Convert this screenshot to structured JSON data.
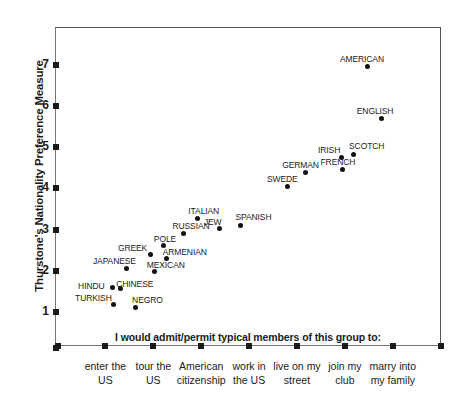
{
  "chart_data": {
    "type": "scatter",
    "title": "",
    "ylabel": "Thurstone's Nationality Preference Measure",
    "xlabel": "",
    "caption": "I would admit/permit typical members of this group to:",
    "ylim": [
      0,
      7.6
    ],
    "yticks": [
      1,
      2,
      3,
      4,
      5,
      6,
      7
    ],
    "ytick_labels": [
      "1",
      "2",
      "3",
      "4",
      "5",
      "6",
      "7"
    ],
    "grid": false,
    "legend": "none",
    "xtick_labels": [
      "enter the\nUS",
      "tour the\nUS",
      "American\ncitizenship",
      "work in\nthe US",
      "live on my\nstreet",
      "join my\nclub",
      "marry into\nmy family"
    ],
    "xticks": [
      {
        "label_line1": "enter the",
        "label_line2": "US"
      },
      {
        "label_line1": "tour the",
        "label_line2": "US"
      },
      {
        "label_line1": "American",
        "label_line2": "citizenship"
      },
      {
        "label_line1": "work in",
        "label_line2": "the US"
      },
      {
        "label_line1": "live on my",
        "label_line2": "street"
      },
      {
        "label_line1": "join my",
        "label_line2": "club"
      },
      {
        "label_line1": "marry into",
        "label_line2": "my family"
      }
    ],
    "point_color": "#111111",
    "axis_color": "#555555",
    "points": [
      {
        "name": "TURKISH",
        "x": 1.16,
        "y": 1.17,
        "lx": -38,
        "ly": -12
      },
      {
        "name": "NEGRO",
        "x": 1.62,
        "y": 1.12,
        "lx": -3,
        "ly": -12
      },
      {
        "name": "HINDU",
        "x": 1.14,
        "y": 1.59,
        "lx": -34,
        "ly": -7
      },
      {
        "name": "CHINESE",
        "x": 1.31,
        "y": 1.58,
        "lx": -4,
        "ly": -9
      },
      {
        "name": "MEXICAN",
        "x": 2.03,
        "y": 1.99,
        "lx": -8,
        "ly": -11
      },
      {
        "name": "JAPANESE",
        "x": 1.45,
        "y": 2.06,
        "lx": -34,
        "ly": -12
      },
      {
        "name": "ARMENIAN",
        "x": 2.28,
        "y": 2.31,
        "lx": -4,
        "ly": -11
      },
      {
        "name": "GREEK",
        "x": 1.95,
        "y": 2.4,
        "lx": -33,
        "ly": -11
      },
      {
        "name": "POLE",
        "x": 2.22,
        "y": 2.62,
        "lx": -10,
        "ly": -11
      },
      {
        "name": "RUSSIAN",
        "x": 2.63,
        "y": 2.91,
        "lx": -11,
        "ly": -12
      },
      {
        "name": "JEW",
        "x": 3.39,
        "y": 3.03,
        "lx": -16,
        "ly": -11
      },
      {
        "name": "SPANISH",
        "x": 3.82,
        "y": 3.1,
        "lx": -5,
        "ly": -13
      },
      {
        "name": "ITALIAN",
        "x": 2.92,
        "y": 3.28,
        "lx": -9,
        "ly": -12
      },
      {
        "name": "SWEDE",
        "x": 4.81,
        "y": 4.05,
        "lx": -21,
        "ly": -12
      },
      {
        "name": "GERMAN",
        "x": 5.17,
        "y": 4.39,
        "lx": -23,
        "ly": -12
      },
      {
        "name": "FRENCH",
        "x": 5.95,
        "y": 4.46,
        "lx": -22,
        "ly": -12
      },
      {
        "name": "IRISH",
        "x": 5.92,
        "y": 4.76,
        "lx": -23,
        "ly": -12
      },
      {
        "name": "SCOTCH",
        "x": 6.17,
        "y": 4.83,
        "lx": -4,
        "ly": -13
      },
      {
        "name": "ENGLISH",
        "x": 6.77,
        "y": 5.7,
        "lx": -25,
        "ly": -12
      },
      {
        "name": "AMERICAN",
        "x": 6.48,
        "y": 6.97,
        "lx": -28,
        "ly": -12
      }
    ]
  }
}
